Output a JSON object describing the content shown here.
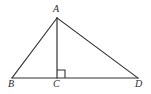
{
  "figure": {
    "kind": "geometry-diagram",
    "background_color": "#ffffff",
    "stroke_color": "#333333",
    "label_color": "#2b2b2b",
    "stroke_width": 1,
    "canvas": {
      "width": 151,
      "height": 94
    }
  },
  "points": {
    "A": {
      "label": "A",
      "x": 57,
      "y": 18,
      "label_x": 53,
      "label_y": 4
    },
    "B": {
      "label": "B",
      "x": 12,
      "y": 78,
      "label_x": 8,
      "label_y": 79
    },
    "C": {
      "label": "C",
      "x": 57,
      "y": 78,
      "label_x": 53,
      "label_y": 79
    },
    "D": {
      "label": "D",
      "x": 138,
      "y": 78,
      "label_x": 135,
      "label_y": 79
    }
  },
  "segments": [
    {
      "name": "AB",
      "from": "A",
      "to": "B",
      "x1": 57,
      "y1": 18,
      "x2": 12,
      "y2": 78
    },
    {
      "name": "AD",
      "from": "A",
      "to": "D",
      "x1": 57,
      "y1": 18,
      "x2": 138,
      "y2": 78
    },
    {
      "name": "BD",
      "from": "B",
      "to": "D",
      "x1": 12,
      "y1": 78,
      "x2": 138,
      "y2": 78
    },
    {
      "name": "AC",
      "from": "A",
      "to": "C",
      "x1": 57,
      "y1": 18,
      "x2": 57,
      "y2": 78
    }
  ],
  "right_angle_marker": {
    "at": "C",
    "size": 8,
    "path": "M 57 70 L 65 70 L 65 78"
  }
}
